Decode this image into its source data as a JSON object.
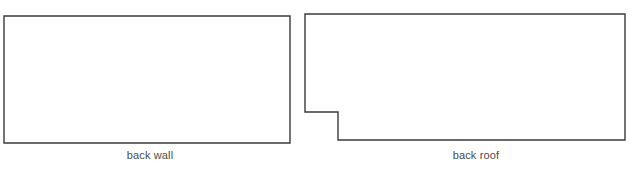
{
  "diagram": {
    "background_color": "#ffffff",
    "stroke_color": "#3a3a3a",
    "stroke_width": 1.4,
    "fill_color": "#ffffff",
    "label_color": "#4a4a4a",
    "shapes": [
      {
        "name": "back-wall",
        "label": "back wall",
        "type": "rectangle",
        "points": "4,16 290,16 290,143 4,143"
      },
      {
        "name": "back-roof",
        "label": "back roof",
        "type": "polygon-notched-rectangle",
        "points": "305,14 625,14 625,140 338,140 338,112 305,112"
      }
    ]
  }
}
